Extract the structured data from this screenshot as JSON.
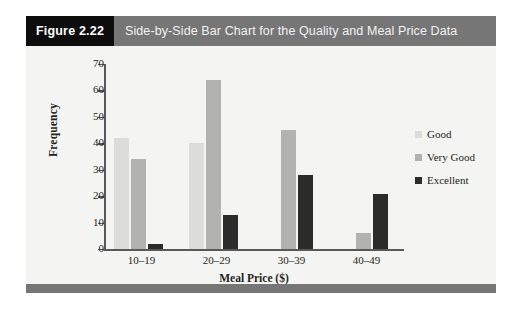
{
  "figure": {
    "number_label": "Figure 2.22",
    "title": "Side-by-Side Bar Chart for the Quality and Meal Price Data"
  },
  "colors": {
    "header_number_bg": "#0d0d0d",
    "header_title_bg": "#767676",
    "footer_rule": "#767676",
    "plot_bg": "#f4f4f2",
    "axis": "#59595b",
    "good": "#dcdcda",
    "very_good": "#b2b2b0",
    "excellent": "#2b2b2b"
  },
  "legend": {
    "position": "right",
    "entries": [
      {
        "label": "Good",
        "color": "#dcdcda"
      },
      {
        "label": "Very Good",
        "color": "#b2b2b0"
      },
      {
        "label": "Excellent",
        "color": "#2b2b2b"
      }
    ]
  },
  "chart_data": {
    "type": "bar",
    "title": "Side-by-Side Bar Chart for the Quality and Meal Price Data",
    "subtitle": "",
    "xlabel": "Meal Price ($)",
    "ylabel": "Frequency",
    "categories": [
      "10–19",
      "20–29",
      "30–39",
      "40–49"
    ],
    "series": [
      {
        "name": "Good",
        "color": "#dcdcda",
        "values": [
          42,
          40,
          0,
          0
        ]
      },
      {
        "name": "Very Good",
        "color": "#b2b2b0",
        "values": [
          34,
          64,
          45,
          6
        ]
      },
      {
        "name": "Excellent",
        "color": "#2b2b2b",
        "values": [
          2,
          13,
          28,
          21
        ]
      }
    ],
    "ylim": [
      0,
      70
    ],
    "yticks": [
      0,
      10,
      20,
      30,
      40,
      50,
      60,
      70
    ],
    "ytick_labels": [
      "0",
      "10",
      "20",
      "30",
      "40",
      "50",
      "60",
      "70"
    ],
    "grid": false,
    "legend_position": "right"
  }
}
